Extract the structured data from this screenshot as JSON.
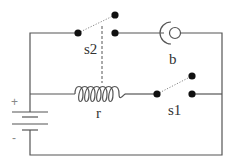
{
  "diagram": {
    "type": "circuit-schematic",
    "components": {
      "switch_s2": {
        "label": "s2"
      },
      "bulb_b": {
        "label": "b"
      },
      "switch_s1": {
        "label": "s1"
      },
      "coil_r": {
        "label": "r"
      },
      "battery": {
        "plus": "+",
        "minus": "-"
      }
    },
    "colors": {
      "wire": "#555555",
      "node": "#111111",
      "background": "#ffffff"
    }
  }
}
